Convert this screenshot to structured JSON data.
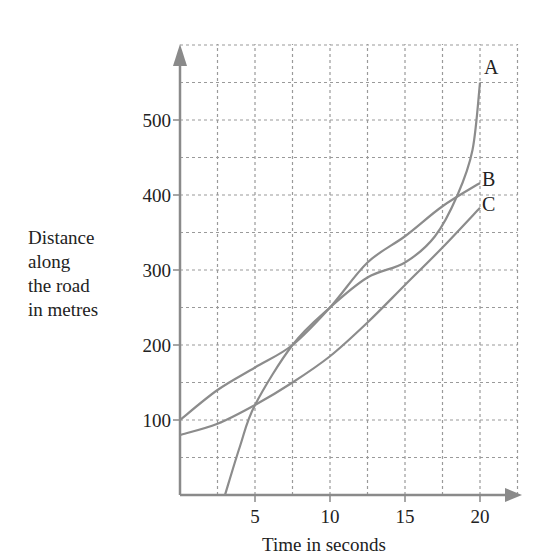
{
  "chart_data": {
    "type": "line",
    "title": "",
    "xlabel": "Time in seconds",
    "ylabel": "Distance along the road in metres",
    "ylabel_lines": [
      "Distance",
      "along",
      "the road",
      "in metres"
    ],
    "xlim": [
      0,
      22.5
    ],
    "ylim": [
      0,
      600
    ],
    "x_ticks": [
      5,
      10,
      15,
      20
    ],
    "y_ticks": [
      100,
      200,
      300,
      400,
      500
    ],
    "grid": true,
    "grid_minor_x": 2.5,
    "grid_minor_y": 50,
    "series": [
      {
        "name": "A",
        "x": [
          3,
          4,
          5,
          7.5,
          10,
          12.5,
          15,
          17,
          18.5,
          19.5,
          20
        ],
        "y": [
          0,
          65,
          120,
          200,
          250,
          290,
          310,
          345,
          400,
          460,
          550
        ]
      },
      {
        "name": "B",
        "x": [
          0,
          2.5,
          5,
          7.5,
          10,
          12.5,
          15,
          17.5,
          20
        ],
        "y": [
          100,
          140,
          170,
          200,
          250,
          310,
          345,
          385,
          416
        ]
      },
      {
        "name": "C",
        "x": [
          0,
          2.5,
          5,
          7.5,
          10,
          12.5,
          15,
          17.5,
          20
        ],
        "y": [
          80,
          95,
          120,
          150,
          185,
          230,
          280,
          330,
          383
        ]
      }
    ],
    "legend_position": "inline-labels-at-line-ends"
  },
  "labels": {
    "x_axis": "Time in seconds",
    "y_axis": [
      "Distance",
      "along",
      "the road",
      "in metres"
    ],
    "x_ticks": [
      "5",
      "10",
      "15",
      "20"
    ],
    "y_ticks": [
      "100",
      "200",
      "300",
      "400",
      "500"
    ],
    "series": [
      "A",
      "B",
      "C"
    ]
  },
  "colors": {
    "axis": "#8a8a8a",
    "grid": "#9a9a9a",
    "curve": "#8c8c8c",
    "text": "#222222"
  }
}
